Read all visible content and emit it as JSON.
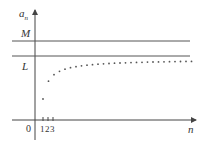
{
  "diagram": {
    "y_axis_label": "a",
    "y_axis_subscript": "n",
    "x_axis_label": "n",
    "origin_label": "0",
    "x_ticks": [
      "1",
      "2",
      "3"
    ],
    "upper_bound_label": "M",
    "limit_label": "L",
    "colors": {
      "axis": "#444444",
      "lines": "#555555",
      "dots": "#555555",
      "text": "#333333"
    }
  },
  "chart_data": {
    "type": "scatter",
    "title": "",
    "xlabel": "n",
    "ylabel": "a_n",
    "horizontal_lines": [
      {
        "label": "M",
        "description": "upper bound"
      },
      {
        "label": "L",
        "description": "limit"
      }
    ],
    "x_tick_labels": [
      "0",
      "1",
      "2",
      "3"
    ],
    "series": [
      {
        "name": "a_n",
        "description": "increasing sequence approaching L from below",
        "points": 28
      }
    ]
  }
}
